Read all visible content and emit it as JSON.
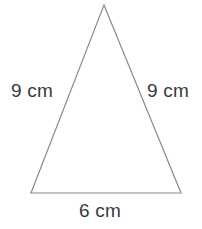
{
  "figure": {
    "type": "geometry-diagram",
    "shape_name": "isosceles triangle",
    "background_color": "#ffffff",
    "stroke_color": "#8a8a8a",
    "stroke_width": 1.2,
    "label_color": "#3a3a3a",
    "vertices": {
      "apex": {
        "x": 104,
        "y": 5
      },
      "bottom_left": {
        "x": 31,
        "y": 193
      },
      "bottom_right": {
        "x": 181,
        "y": 193
      }
    },
    "labels": {
      "left_side": "9 cm",
      "right_side": "9 cm",
      "base": "6 cm"
    }
  },
  "chart_data": {
    "type": "diagram",
    "title": "",
    "shape": "isosceles triangle",
    "sides": [
      {
        "name": "left",
        "length": 9,
        "unit": "cm",
        "label": "9 cm"
      },
      {
        "name": "right",
        "length": 9,
        "unit": "cm",
        "label": "9 cm"
      },
      {
        "name": "base",
        "length": 6,
        "unit": "cm",
        "label": "6 cm"
      }
    ]
  }
}
